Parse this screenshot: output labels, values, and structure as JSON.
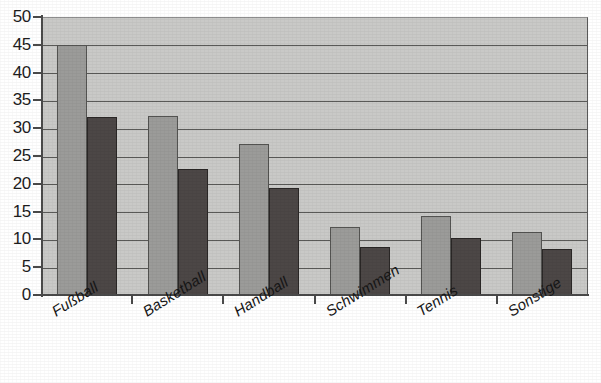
{
  "chart_data": {
    "type": "bar",
    "title": "",
    "subtitle": "",
    "xlabel": "",
    "ylabel": "",
    "ylim": [
      0,
      50
    ],
    "ytick_step": 5,
    "yticks": [
      0,
      5,
      10,
      15,
      20,
      25,
      30,
      35,
      40,
      45,
      50
    ],
    "ytick_labels": [
      "0",
      "5",
      "10",
      "15",
      "20",
      "25",
      "30",
      "35",
      "40",
      "45",
      "50"
    ],
    "grid": true,
    "grid_axis": "y",
    "legend": false,
    "legend_position": "none",
    "categories": [
      "Fußball",
      "Basketball",
      "Handball",
      "Schwimmen",
      "Tennis",
      "Sonstige"
    ],
    "series": [
      {
        "name": "Reihe 1",
        "color": "#9b9b99",
        "values": [
          45.0,
          32.2,
          27.2,
          12.2,
          14.3,
          11.3
        ]
      },
      {
        "name": "Reihe 2",
        "color": "#4c4746",
        "values": [
          32.0,
          22.7,
          19.3,
          8.7,
          10.2,
          8.2
        ]
      }
    ],
    "annotations": [],
    "plot_background": "#c9c9c7",
    "axis_color": "#4a4a4a",
    "gridline_color": "#5a5a58"
  }
}
